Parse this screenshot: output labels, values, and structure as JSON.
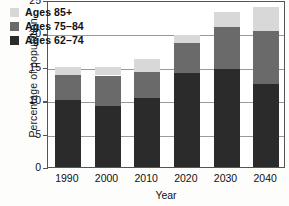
{
  "chart_data": {
    "type": "bar",
    "subtype": "stacked-bar",
    "title": "",
    "xlabel": "Year",
    "ylabel": "Percentage of population",
    "categories": [
      "1990",
      "2000",
      "2010",
      "2020",
      "2030",
      "2040"
    ],
    "series": [
      {
        "name": "Ages 62–74",
        "color": "#2b2b2b",
        "values": [
          10.1,
          9.2,
          10.3,
          14.0,
          14.7,
          12.5
        ]
      },
      {
        "name": "Ages 75–84",
        "color": "#6a6a6a",
        "values": [
          3.7,
          4.5,
          3.9,
          4.5,
          6.2,
          7.8
        ]
      },
      {
        "name": "Ages 85+",
        "color": "#d8d8d8",
        "values": [
          1.2,
          1.3,
          2.0,
          1.3,
          2.3,
          3.7
        ]
      }
    ],
    "totals": [
      15.0,
      15.0,
      16.2,
      19.8,
      23.2,
      24.0
    ],
    "ylim": [
      0,
      25
    ],
    "yticks": [
      "0",
      "5",
      "10",
      "15",
      "20",
      "25"
    ],
    "grid": true,
    "legend_position": "top-left",
    "legend_entries": [
      "Ages 85+",
      "Ages 75–84",
      "Ages 62–74"
    ]
  },
  "legend": {
    "rows": [
      {
        "label": "Ages 85+",
        "color": "#d8d8d8"
      },
      {
        "label": "Ages 75–84",
        "color": "#6a6a6a"
      },
      {
        "label": "Ages 62–74",
        "color": "#2b2b2b"
      }
    ]
  },
  "axes": {
    "y_title": "Percentage of population",
    "x_title": "Year",
    "y_ticks": [
      "25",
      "20",
      "15",
      "10",
      "5",
      "0"
    ],
    "x_ticks": [
      "1990",
      "2000",
      "2010",
      "2020",
      "2030",
      "2040"
    ]
  }
}
